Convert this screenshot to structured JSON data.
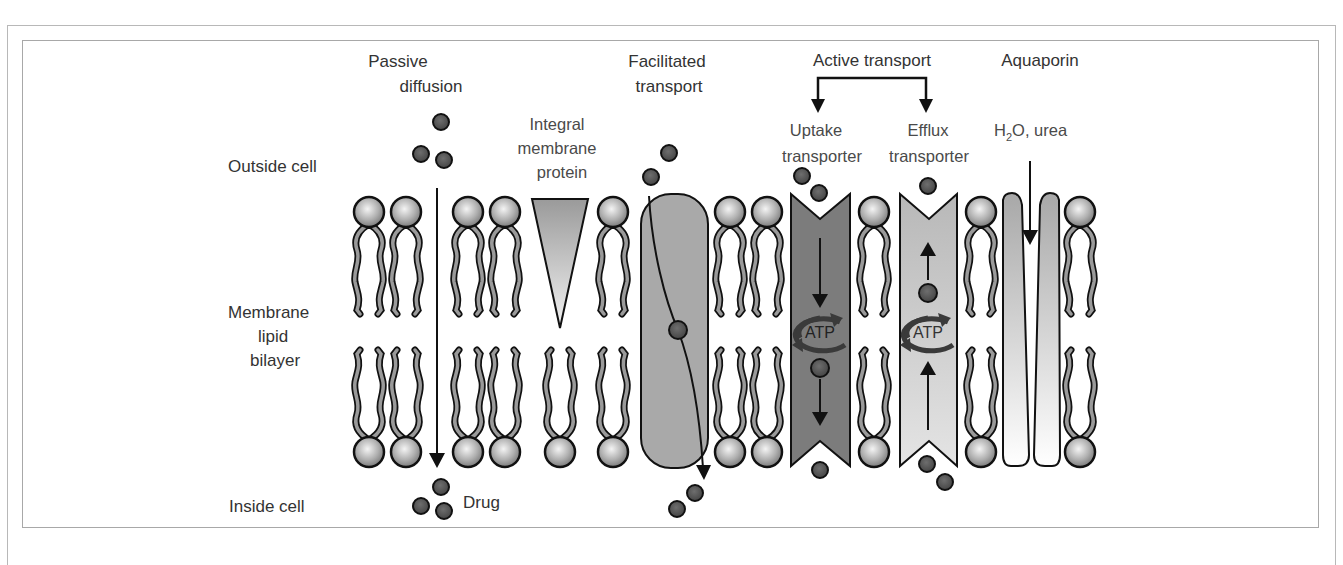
{
  "diagram": {
    "side_labels": {
      "outside": "Outside cell",
      "membrane_line1": "Membrane",
      "membrane_line2": "lipid",
      "membrane_line3": "bilayer",
      "inside": "Inside cell"
    },
    "mechanisms": {
      "passive": {
        "line1": "Passive",
        "line2": "diffusion"
      },
      "integral": {
        "line1": "Integral",
        "line2": "membrane",
        "line3": "protein"
      },
      "facilitated": {
        "line1": "Facilitated",
        "line2": "transport"
      },
      "active": {
        "title": "Active transport"
      },
      "uptake": {
        "line1": "Uptake",
        "line2": "transporter",
        "energy": "ATP"
      },
      "efflux": {
        "line1": "Efflux",
        "line2": "transporter",
        "energy": "ATP"
      },
      "aquaporin": {
        "title": "Aquaporin",
        "substrate_h": "H",
        "substrate_sub": "2",
        "substrate_rest": "O, urea"
      }
    },
    "drug_label": "Drug",
    "colors": {
      "outline": "#1a1a1a",
      "drug_molecule": "#5a5a5a",
      "uptake_transporter": "#7a7a7a",
      "efflux_transporter": "#c8c8c8",
      "facilitated_channel": "#a8a8a8",
      "lipid_head": "#b5b5b5"
    },
    "lipid_columns_x": [
      369,
      406,
      468,
      505,
      613,
      730,
      767,
      874,
      981,
      1080
    ]
  }
}
